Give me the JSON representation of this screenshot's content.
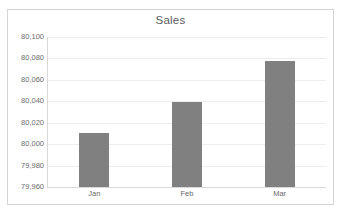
{
  "chart_data": {
    "type": "bar",
    "title": "Sales",
    "categories": [
      "Jan",
      "Feb",
      "Mar"
    ],
    "values": [
      80010,
      80039,
      80078
    ],
    "series": [
      {
        "name": "Sales",
        "values": [
          80010,
          80039,
          80078
        ]
      }
    ],
    "xlabel": "",
    "ylabel": "",
    "ylim": [
      79960,
      80100
    ],
    "ytick_step": 20,
    "ytick_labels": [
      "80,100",
      "80,080",
      "80,060",
      "80,040",
      "80,020",
      "80,000",
      "79,980",
      "79,960"
    ],
    "ytick_values": [
      80100,
      80080,
      80060,
      80040,
      80020,
      80000,
      79980,
      79960
    ],
    "grid": true,
    "legend": false,
    "legend_position": "none",
    "colors": {
      "bar": "#808080",
      "gridline": "#ededed",
      "axis_line": "#d9d9d9",
      "title_text": "#5b5b5b",
      "tick_text": "#6b6b6b",
      "chart_border": "#d4d4d4",
      "plot_background": "#ffffff"
    }
  }
}
